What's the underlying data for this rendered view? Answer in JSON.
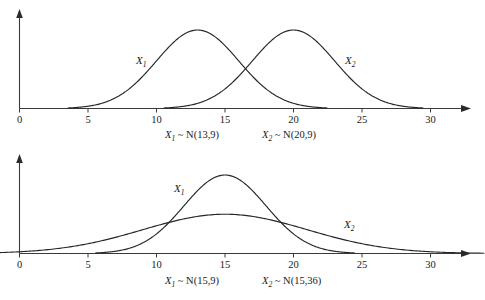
{
  "figure": {
    "background_color": "#ffffff",
    "line_color": "#262626",
    "axis_color": "#3a3a3a",
    "text_color": "#1a1a1a"
  },
  "chart_data": [
    {
      "type": "line",
      "title": "",
      "subtitle": "",
      "xlabel": "",
      "ylabel": "",
      "grid": false,
      "legend_position": "inline-annotation",
      "xlim": [
        0,
        32
      ],
      "ylim": [
        0,
        0.16
      ],
      "xticks": [
        0,
        5,
        10,
        15,
        20,
        25,
        30
      ],
      "xticklabels": [
        "0",
        "5",
        "10",
        "15",
        "20",
        "25",
        "30"
      ],
      "yticks": [],
      "yticklabels": [],
      "series": [
        {
          "name": "X1",
          "label": "X",
          "subscript": "1",
          "distribution": "normal",
          "mean": 13,
          "variance": 9,
          "sigma": 3,
          "peak_x": 13,
          "peak_density": 0.133,
          "caption": "X₁ ~ N(13,9)",
          "caption_var": "X",
          "caption_sub": "1",
          "caption_rest": " ~ N(13,9)",
          "annotation_x": 9.0,
          "annotation_y": 0.0705
        },
        {
          "name": "X2",
          "label": "X",
          "subscript": "2",
          "distribution": "normal",
          "mean": 20,
          "variance": 9,
          "sigma": 3,
          "peak_x": 20,
          "peak_density": 0.133,
          "caption": "X₂ ~ N(20,9)",
          "caption_var": "X",
          "caption_sub": "2",
          "caption_rest": " ~ N(20,9)",
          "annotation_x": 24.0,
          "annotation_y": 0.0705
        }
      ],
      "caption_row": [
        "X₁ ~ N(13,9)",
        "X₂ ~ N(20,9)"
      ]
    },
    {
      "type": "line",
      "title": "",
      "subtitle": "",
      "xlabel": "",
      "ylabel": "",
      "grid": false,
      "legend_position": "inline-annotation",
      "xlim": [
        0,
        32
      ],
      "ylim": [
        0,
        0.16
      ],
      "xticks": [
        0,
        5,
        10,
        15,
        20,
        25,
        30
      ],
      "xticklabels": [
        "0",
        "5",
        "10",
        "15",
        "20",
        "25",
        "30"
      ],
      "yticks": [],
      "yticklabels": [],
      "series": [
        {
          "name": "X1",
          "label": "X",
          "subscript": "1",
          "distribution": "normal",
          "mean": 15,
          "variance": 9,
          "sigma": 3,
          "peak_x": 15,
          "peak_density": 0.133,
          "caption": "X₁ ~ N(15,9)",
          "caption_var": "X",
          "caption_sub": "1",
          "caption_rest": " ~ N(15,9)",
          "annotation_x": 11.8,
          "annotation_y": 0.099
        },
        {
          "name": "X2",
          "label": "X",
          "subscript": "2",
          "distribution": "normal",
          "mean": 15,
          "variance": 36,
          "sigma": 6,
          "peak_x": 15,
          "peak_density": 0.0665,
          "caption": "X₂ ~ N(15,36)",
          "caption_var": "X",
          "caption_sub": "2",
          "caption_rest": " ~ N(15,36)",
          "annotation_x": 24.0,
          "annotation_y": 0.0425
        }
      ],
      "caption_row": [
        "X₁ ~ N(15,9)",
        "X₂ ~ N(15,36)"
      ]
    }
  ],
  "panels": [
    {
      "id": "top-panel",
      "name": "normal-curves-different-means",
      "ticklabels": [
        "0",
        "5",
        "10",
        "15",
        "20",
        "25",
        "30"
      ],
      "curve_labels": [
        {
          "var": "X",
          "sub": "1"
        },
        {
          "var": "X",
          "sub": "2"
        }
      ],
      "captions": [
        {
          "var": "X",
          "sub": "1",
          "rest": " ~ N(13,9)"
        },
        {
          "var": "X",
          "sub": "2",
          "rest": " ~ N(20,9)"
        }
      ]
    },
    {
      "id": "bottom-panel",
      "name": "normal-curves-same-mean-different-variance",
      "ticklabels": [
        "0",
        "5",
        "10",
        "15",
        "20",
        "25",
        "30"
      ],
      "curve_labels": [
        {
          "var": "X",
          "sub": "1"
        },
        {
          "var": "X",
          "sub": "2"
        }
      ],
      "captions": [
        {
          "var": "X",
          "sub": "1",
          "rest": " ~ N(15,9)"
        },
        {
          "var": "X",
          "sub": "2",
          "rest": " ~ N(15,36)"
        }
      ]
    }
  ]
}
